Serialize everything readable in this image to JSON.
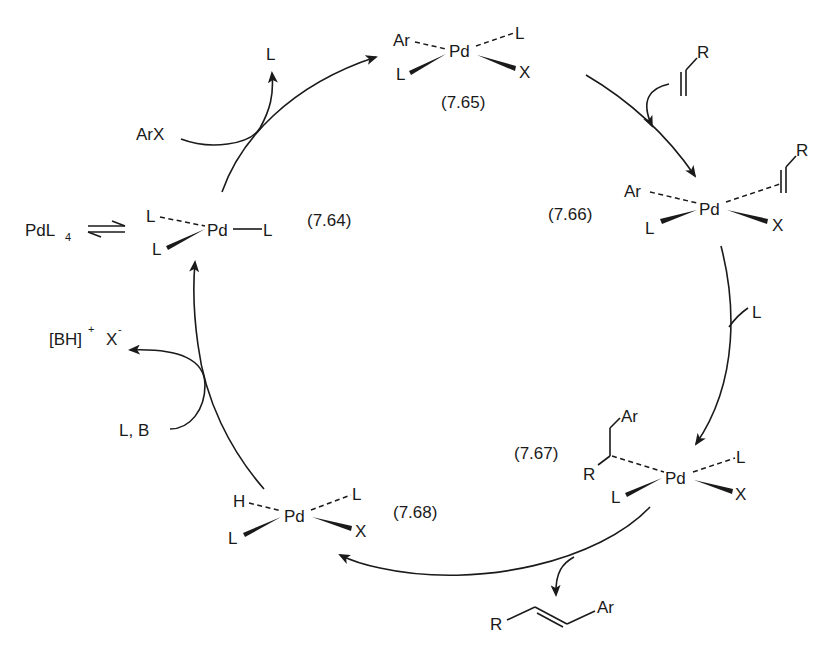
{
  "diagram": {
    "type": "catalytic-cycle",
    "colors": {
      "ink": "#1a1a1a",
      "background": "#ffffff"
    },
    "precatalyst": {
      "label": "PdL",
      "subscript": "4",
      "equilibrium_icon": "equilibrium-arrows"
    },
    "complexes": [
      {
        "id": "7.64",
        "label": "(7.64)",
        "center": "Pd",
        "ligands": {
          "dashed_left": "L",
          "wedge_left": "L",
          "plain_right": "L"
        }
      },
      {
        "id": "7.65",
        "label": "(7.65)",
        "center": "Pd",
        "ligands": {
          "dashed_left": "Ar",
          "dashed_right": "L",
          "wedge_left": "L",
          "wedge_right": "X"
        }
      },
      {
        "id": "7.66",
        "label": "(7.66)",
        "center": "Pd",
        "ligands": {
          "dashed_left": "Ar",
          "dashed_right": "alkene",
          "alkene_substituent": "R",
          "wedge_left": "L",
          "wedge_right": "X"
        }
      },
      {
        "id": "7.67",
        "label": "(7.67)",
        "center": "Pd",
        "ligands": {
          "dashed_left": "alkyl",
          "alkyl_top": "Ar",
          "alkyl_bottom": "R",
          "dashed_right": "L",
          "wedge_left": "L",
          "wedge_right": "X"
        }
      },
      {
        "id": "7.68",
        "label": "(7.68)",
        "center": "Pd",
        "ligands": {
          "dashed_left": "H",
          "dashed_right": "L",
          "wedge_left": "L",
          "wedge_right": "X"
        }
      }
    ],
    "side_species": {
      "arx_in": "ArX",
      "l_out_top": "L",
      "alkene_in_substituent": "R",
      "l_out_right": "L",
      "product_left": "R",
      "product_right": "Ar",
      "base_in": "L, B",
      "salt_out": {
        "main": "[BH]",
        "charge_plus": "+",
        "anion": "X",
        "charge_minus": "-"
      }
    }
  }
}
